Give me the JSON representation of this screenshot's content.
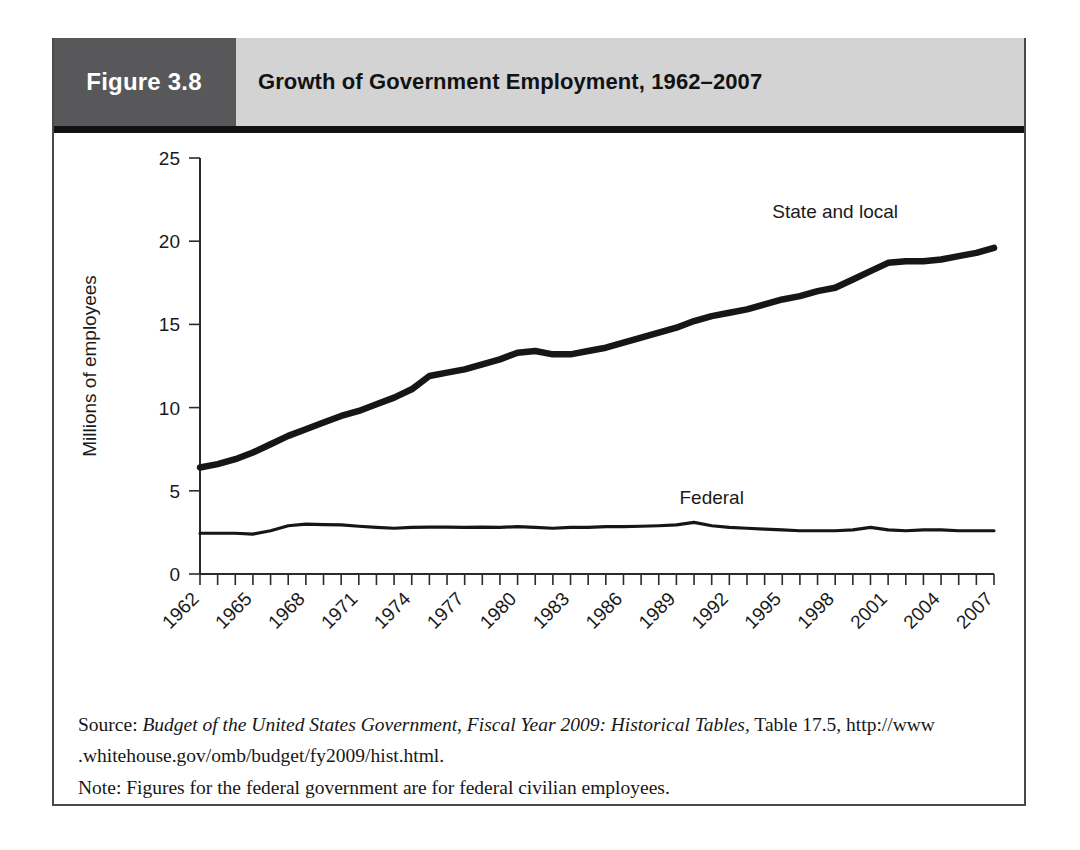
{
  "figure": {
    "number_label": "Figure 3.8",
    "title": "Growth of Government Employment, 1962–2007",
    "header_number_bg": "#58585a",
    "header_title_bg": "#d3d3d3",
    "rule_color": "#111111",
    "border_color": "#4a4a4a"
  },
  "source": {
    "prefix": "Source: ",
    "italic_title": "Budget of the United States Government, Fiscal Year 2009: Historical Tables,",
    "tail": " Table 17.5, http://www",
    "line2": ".whitehouse.gov/omb/budget/fy2009/hist.html.",
    "note": "Note: Figures for the federal government are for federal civilian employees."
  },
  "chart_data": {
    "type": "line",
    "title": "Growth of Government Employment, 1962–2007",
    "xlabel": "",
    "ylabel": "Millions of employees",
    "xlim": [
      1962,
      2007
    ],
    "ylim": [
      0,
      25
    ],
    "yticks": [
      0,
      5,
      10,
      15,
      20,
      25
    ],
    "ytick_labels": [
      "0",
      "5",
      "10",
      "15",
      "20",
      "25"
    ],
    "x_tick_step": 1,
    "x_label_step": 3,
    "grid": false,
    "legend_position": "inline-annotation",
    "x": [
      1962,
      1963,
      1964,
      1965,
      1966,
      1967,
      1968,
      1969,
      1970,
      1971,
      1972,
      1973,
      1974,
      1975,
      1976,
      1977,
      1978,
      1979,
      1980,
      1981,
      1982,
      1983,
      1984,
      1985,
      1986,
      1987,
      1988,
      1989,
      1990,
      1991,
      1992,
      1993,
      1994,
      1995,
      1996,
      1997,
      1998,
      1999,
      2000,
      2001,
      2002,
      2003,
      2004,
      2005,
      2006,
      2007
    ],
    "x_labels": [
      "1962",
      "1965",
      "1968",
      "1971",
      "1974",
      "1977",
      "1980",
      "1983",
      "1986",
      "1989",
      "1992",
      "1995",
      "1998",
      "2001",
      "2004",
      "2007"
    ],
    "series": [
      {
        "name": "State and local",
        "style": "thick",
        "color": "#161616",
        "label_anchor_year": 1998,
        "label_value": 21.4,
        "values": [
          6.4,
          6.6,
          6.9,
          7.3,
          7.8,
          8.3,
          8.7,
          9.1,
          9.5,
          9.8,
          10.2,
          10.6,
          11.1,
          11.9,
          12.1,
          12.3,
          12.6,
          12.9,
          13.3,
          13.4,
          13.2,
          13.2,
          13.4,
          13.6,
          13.9,
          14.2,
          14.5,
          14.8,
          15.2,
          15.5,
          15.7,
          15.9,
          16.2,
          16.5,
          16.7,
          17.0,
          17.2,
          17.7,
          18.2,
          18.7,
          18.8,
          18.8,
          18.9,
          19.1,
          19.3,
          19.6
        ]
      },
      {
        "name": "Federal",
        "style": "thin",
        "color": "#161616",
        "label_anchor_year": 1991,
        "label_value": 4.2,
        "values": [
          2.45,
          2.45,
          2.45,
          2.4,
          2.6,
          2.9,
          3.0,
          2.97,
          2.95,
          2.87,
          2.8,
          2.75,
          2.8,
          2.82,
          2.82,
          2.8,
          2.82,
          2.8,
          2.85,
          2.8,
          2.75,
          2.8,
          2.8,
          2.85,
          2.85,
          2.87,
          2.9,
          2.95,
          3.1,
          2.9,
          2.8,
          2.75,
          2.7,
          2.65,
          2.6,
          2.6,
          2.6,
          2.65,
          2.8,
          2.65,
          2.6,
          2.65,
          2.65,
          2.6,
          2.6,
          2.6
        ]
      }
    ]
  }
}
